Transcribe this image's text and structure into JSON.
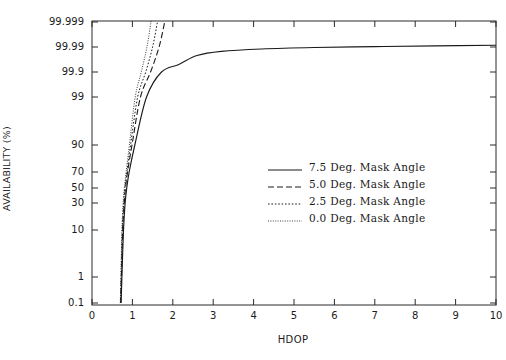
{
  "chart_data": {
    "type": "line",
    "title": "",
    "xlabel": "HDOP",
    "ylabel": "AVAILABILITY (%)",
    "xlim": [
      0,
      10
    ],
    "xticks": [
      0,
      1,
      2,
      3,
      4,
      5,
      6,
      7,
      8,
      9,
      10
    ],
    "xtick_labels": [
      "0",
      "1",
      "2",
      "3",
      "4",
      "5",
      "6",
      "7",
      "8",
      "9",
      "10"
    ],
    "yscale": "probability",
    "yticks": [
      0.1,
      1,
      10,
      30,
      50,
      70,
      90,
      99,
      99.9,
      99.99,
      99.999
    ],
    "ytick_labels": [
      "0.1",
      "1",
      "10",
      "30",
      "50",
      "70",
      "90",
      "99",
      "99.9",
      "99.99",
      "99.999"
    ],
    "ylim": [
      0.1,
      99.999
    ],
    "grid": false,
    "legend_position": "center-right",
    "series": [
      {
        "name": "7.5 Deg. Mask Angle",
        "style": "solid",
        "points": [
          [
            0.72,
            0.1
          ],
          [
            0.74,
            1
          ],
          [
            0.78,
            10
          ],
          [
            0.82,
            30
          ],
          [
            0.86,
            50
          ],
          [
            0.92,
            70
          ],
          [
            1.06,
            90
          ],
          [
            1.35,
            99
          ],
          [
            1.72,
            99.9
          ],
          [
            2.15,
            99.95
          ],
          [
            2.6,
            99.978
          ],
          [
            3.2,
            99.985
          ],
          [
            4.2,
            99.988
          ],
          [
            5.5,
            99.9895
          ],
          [
            7.0,
            99.9903
          ],
          [
            8.5,
            99.991
          ],
          [
            10,
            99.9915
          ]
        ]
      },
      {
        "name": "5.0 Deg. Mask Angle",
        "style": "dashed",
        "points": [
          [
            0.71,
            0.1
          ],
          [
            0.73,
            1
          ],
          [
            0.76,
            10
          ],
          [
            0.8,
            30
          ],
          [
            0.83,
            50
          ],
          [
            0.88,
            70
          ],
          [
            0.99,
            90
          ],
          [
            1.2,
            99
          ],
          [
            1.45,
            99.9
          ],
          [
            1.66,
            99.99
          ],
          [
            1.8,
            99.999
          ]
        ]
      },
      {
        "name": "2.5 Deg. Mask Angle",
        "style": "dotted",
        "points": [
          [
            0.705,
            0.1
          ],
          [
            0.72,
            1
          ],
          [
            0.75,
            10
          ],
          [
            0.785,
            30
          ],
          [
            0.815,
            50
          ],
          [
            0.865,
            70
          ],
          [
            0.955,
            90
          ],
          [
            1.13,
            99
          ],
          [
            1.33,
            99.9
          ],
          [
            1.5,
            99.99
          ],
          [
            1.62,
            99.999
          ]
        ]
      },
      {
        "name": "0.0 Deg. Mask Angle",
        "style": "fine-dotted",
        "points": [
          [
            0.7,
            0.1
          ],
          [
            0.715,
            1
          ],
          [
            0.74,
            10
          ],
          [
            0.77,
            30
          ],
          [
            0.8,
            50
          ],
          [
            0.845,
            70
          ],
          [
            0.925,
            90
          ],
          [
            1.07,
            99
          ],
          [
            1.22,
            99.9
          ],
          [
            1.36,
            99.99
          ],
          [
            1.46,
            99.999
          ]
        ]
      }
    ]
  },
  "legend": {
    "entries": [
      {
        "label": "7.5 Deg. Mask Angle",
        "style": "solid"
      },
      {
        "label": "5.0 Deg. Mask Angle",
        "style": "dashed"
      },
      {
        "label": "2.5 Deg. Mask Angle",
        "style": "dotted"
      },
      {
        "label": "0.0 Deg. Mask Angle",
        "style": "fine-dotted"
      }
    ]
  },
  "axes": {
    "frame_color": "#2a2a2a",
    "line_color": "#1a1a1a"
  }
}
